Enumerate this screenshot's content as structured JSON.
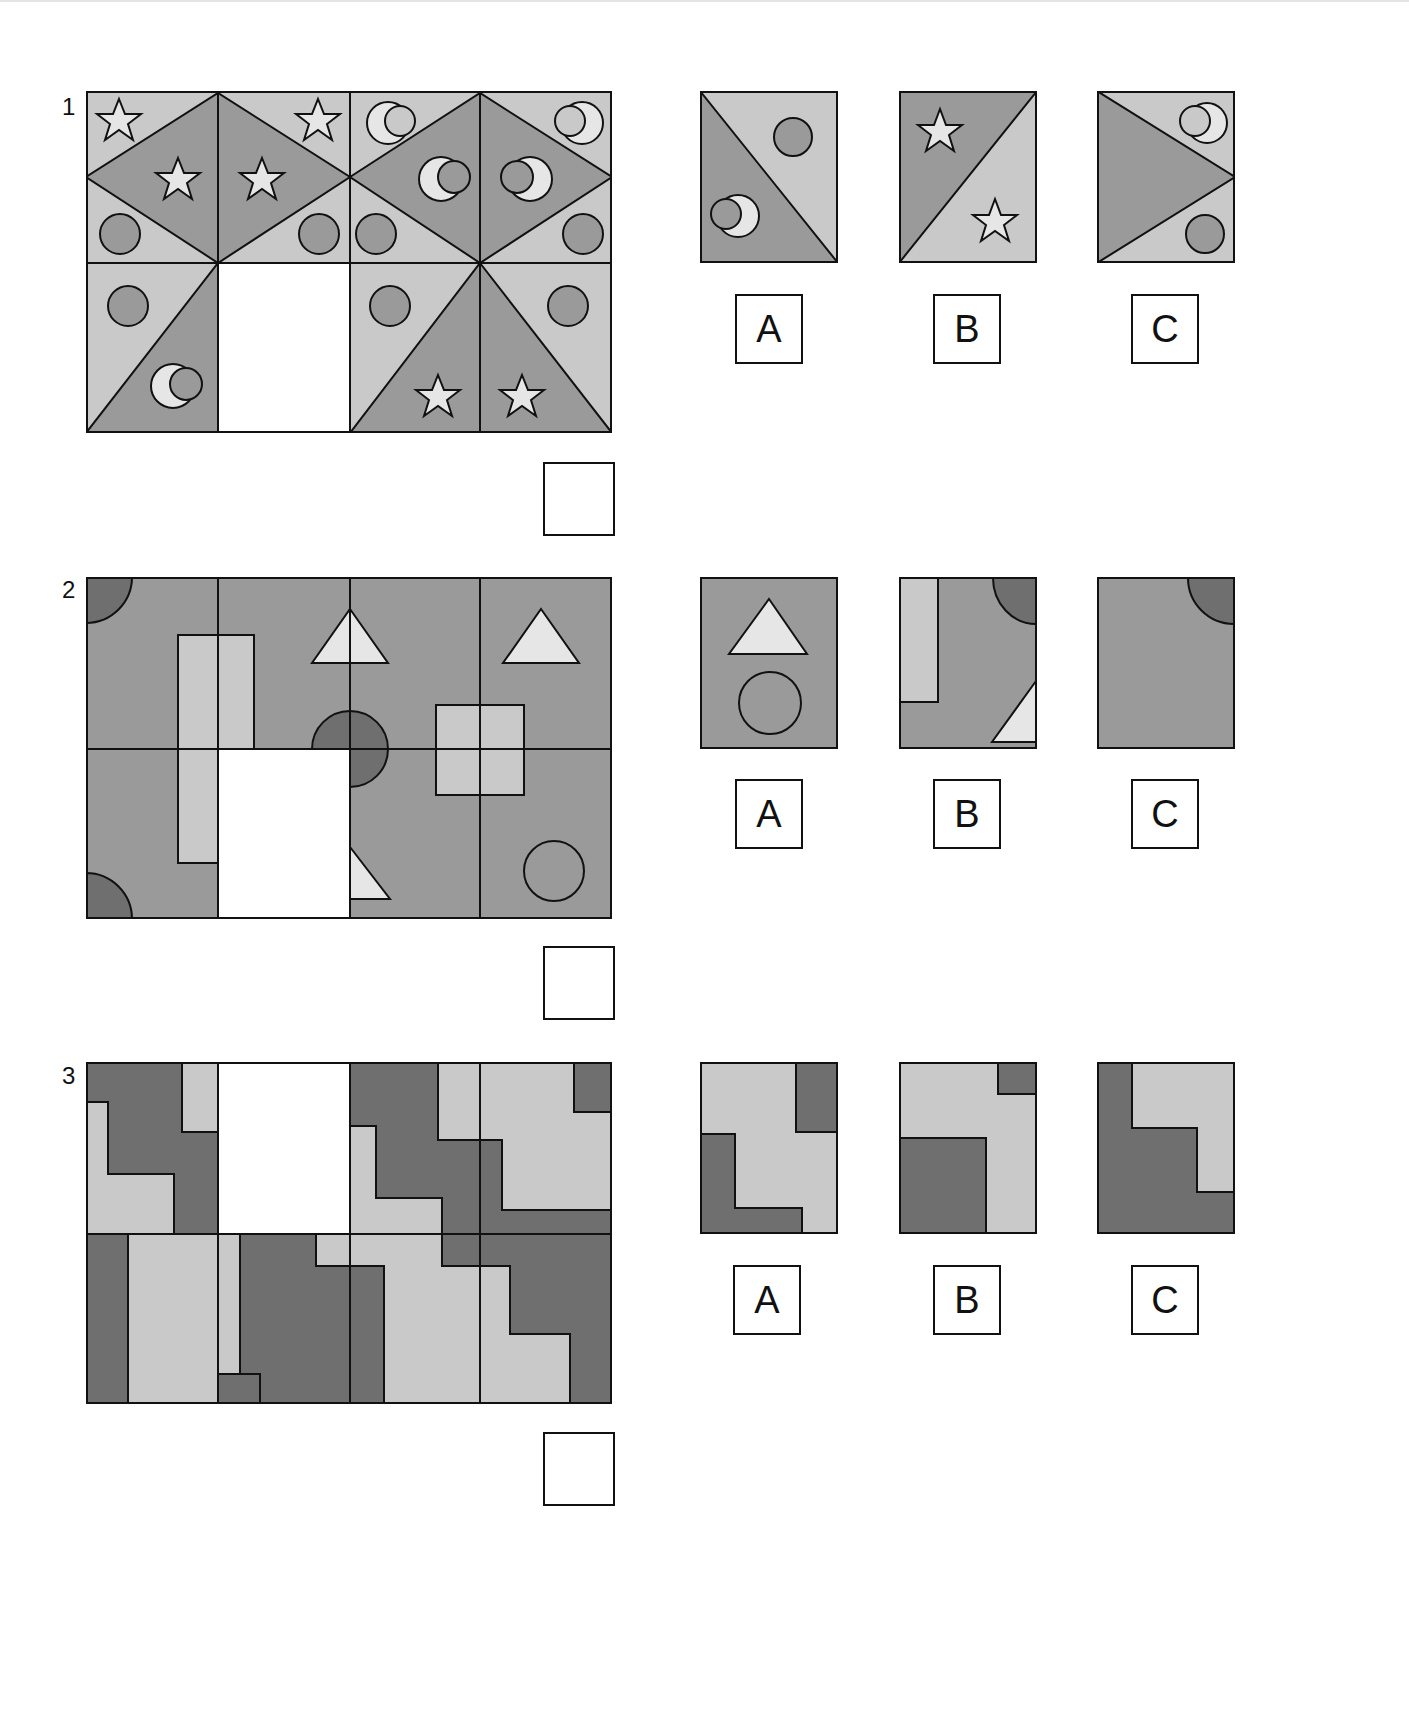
{
  "colors": {
    "light": "#c9c9c9",
    "mid": "#9a9a9a",
    "dark": "#6f6f6f",
    "shape_light": "#e6e6e6",
    "line": "#111111",
    "blank": "#ffffff"
  },
  "questions": [
    {
      "number": "1",
      "grid": {
        "rows": 2,
        "cols": 4,
        "missing_cell": "row 2, column 2"
      },
      "motifs": [
        "star",
        "crescent-moon",
        "circle",
        "diamond",
        "triangle"
      ],
      "options": [
        {
          "label": "A",
          "content": "diagonal split: dark lower-left with crescent moon, light upper-right with circle"
        },
        {
          "label": "B",
          "content": "diagonal split: dark upper-left with star, light lower-right with star"
        },
        {
          "label": "C",
          "content": "dark left triangle, light top-right with crescent moon, light bottom-right with circle"
        }
      ],
      "answer": ""
    },
    {
      "number": "2",
      "grid": {
        "rows": 2,
        "cols": 4,
        "missing_cell": "row 2, column 2"
      },
      "motifs": [
        "quarter-circle",
        "rectangle",
        "triangle",
        "semicircle",
        "square",
        "circle"
      ],
      "options": [
        {
          "label": "A",
          "content": "light triangle above a circle"
        },
        {
          "label": "B",
          "content": "light bar at left, dark quarter-circle top-right, partial triangle bottom-right"
        },
        {
          "label": "C",
          "content": "plain tile with dark quarter-circle top-right"
        }
      ],
      "answer": ""
    },
    {
      "number": "3",
      "grid": {
        "rows": 2,
        "cols": 4,
        "missing_cell": "row 1, column 2"
      },
      "motifs": [
        "staircase",
        "two-tone blocks"
      ],
      "options": [
        {
          "label": "A",
          "content": "light tile with dark top-right block and dark L-shape bottom-left"
        },
        {
          "label": "B",
          "content": "light tile with small dark top-right square and large dark bottom-left block"
        },
        {
          "label": "C",
          "content": "dark tile with light stepped region top-right"
        }
      ],
      "answer": ""
    }
  ]
}
